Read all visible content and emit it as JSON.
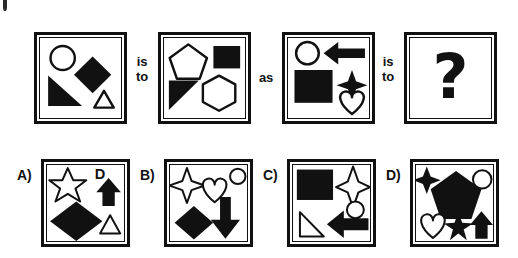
{
  "puzzle": {
    "type": "visual-analogy",
    "format": "A is to B as C is to ?",
    "connectors": {
      "first": {
        "line1": "is",
        "line2": "to"
      },
      "middle": "as",
      "second": {
        "line1": "is",
        "line2": "to"
      }
    },
    "unknown_glyph": "?",
    "colors": {
      "ink": "#111111",
      "paper": "#ffffff"
    }
  },
  "prompt_panels": [
    {
      "id": "panel-a",
      "position": 1,
      "shapes": [
        {
          "name": "circle",
          "fill": "outline",
          "location": "top-left"
        },
        {
          "name": "diamond",
          "fill": "solid",
          "location": "center-right"
        },
        {
          "name": "right-triangle",
          "fill": "solid",
          "location": "bottom-left"
        },
        {
          "name": "triangle",
          "fill": "outline",
          "location": "bottom-right"
        }
      ]
    },
    {
      "id": "panel-b",
      "position": 2,
      "shapes": [
        {
          "name": "pentagon",
          "fill": "outline",
          "location": "top-left"
        },
        {
          "name": "square",
          "fill": "solid",
          "location": "top-right"
        },
        {
          "name": "right-triangle",
          "fill": "solid",
          "location": "bottom-left"
        },
        {
          "name": "hexagon",
          "fill": "outline",
          "location": "bottom-right"
        }
      ]
    },
    {
      "id": "panel-c",
      "position": 3,
      "shapes": [
        {
          "name": "circle",
          "fill": "outline",
          "location": "top-left"
        },
        {
          "name": "left-arrow",
          "fill": "solid",
          "location": "top-right"
        },
        {
          "name": "square",
          "fill": "solid",
          "location": "bottom-left"
        },
        {
          "name": "four-point-star",
          "fill": "solid",
          "location": "middle-right"
        },
        {
          "name": "heart",
          "fill": "outline",
          "location": "bottom-right"
        }
      ]
    },
    {
      "id": "panel-d",
      "position": 4,
      "shapes": [],
      "is_unknown": true
    }
  ],
  "options": [
    {
      "id": "option-a",
      "label": "A)",
      "shapes": [
        {
          "name": "five-point-star",
          "fill": "outline",
          "location": "top-left"
        },
        {
          "name": "letter-d",
          "fill": "solid",
          "location": "top-right",
          "text": "D"
        },
        {
          "name": "up-arrow",
          "fill": "solid",
          "location": "top-right"
        },
        {
          "name": "diamond",
          "fill": "solid",
          "location": "center"
        },
        {
          "name": "triangle",
          "fill": "outline",
          "location": "bottom-right"
        }
      ]
    },
    {
      "id": "option-b",
      "label": "B)",
      "shapes": [
        {
          "name": "four-point-star",
          "fill": "outline",
          "location": "top-left"
        },
        {
          "name": "heart",
          "fill": "outline",
          "location": "top-center"
        },
        {
          "name": "circle",
          "fill": "outline",
          "location": "top-right"
        },
        {
          "name": "diamond",
          "fill": "solid",
          "location": "bottom-left"
        },
        {
          "name": "down-arrow",
          "fill": "solid",
          "location": "bottom-right"
        }
      ]
    },
    {
      "id": "option-c",
      "label": "C)",
      "shapes": [
        {
          "name": "square",
          "fill": "solid",
          "location": "top-left"
        },
        {
          "name": "four-point-star",
          "fill": "outline",
          "location": "top-right"
        },
        {
          "name": "circle",
          "fill": "outline",
          "location": "middle-right"
        },
        {
          "name": "right-triangle",
          "fill": "outline",
          "location": "bottom-left"
        },
        {
          "name": "left-arrow",
          "fill": "solid",
          "location": "bottom-right"
        }
      ]
    },
    {
      "id": "option-d",
      "label": "D)",
      "shapes": [
        {
          "name": "four-point-star",
          "fill": "solid",
          "location": "top-left"
        },
        {
          "name": "pentagon",
          "fill": "solid",
          "location": "center"
        },
        {
          "name": "circle",
          "fill": "outline",
          "location": "top-right"
        },
        {
          "name": "heart",
          "fill": "outline",
          "location": "bottom-left"
        },
        {
          "name": "five-point-star",
          "fill": "solid",
          "location": "bottom-center"
        },
        {
          "name": "up-arrow",
          "fill": "solid",
          "location": "bottom-right"
        }
      ]
    }
  ]
}
